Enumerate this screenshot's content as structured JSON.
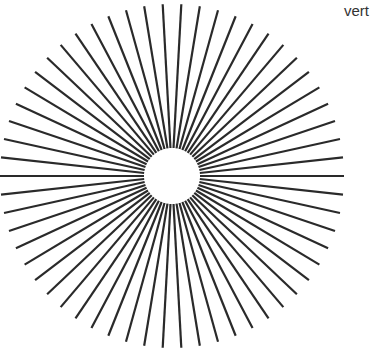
{
  "caption": "vert",
  "figure": {
    "type": "radial-line-pattern",
    "center": [
      172,
      176
    ],
    "inner_radius": 28,
    "outer_radius": 172,
    "spoke_count": 58,
    "stroke_color": "#2a2a2a",
    "stroke_width": 2.2,
    "background": "#ffffff"
  }
}
